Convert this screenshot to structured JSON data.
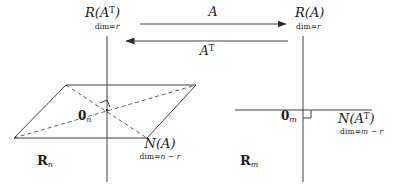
{
  "figure": {
    "stroke_color": "#2b2b2b",
    "background": "#ffffff"
  },
  "left_space": {
    "domain_label": "R",
    "domain_sub": "n",
    "origin_label": "0",
    "origin_sub": "n",
    "row_space": {
      "script": "R",
      "arg_open": "(",
      "arg": "A",
      "arg_sup": "T",
      "arg_close": ")",
      "dim_prefix": "dim",
      "dim_eq": "=",
      "dim_value": "r"
    },
    "null_space": {
      "script": "N",
      "arg_open": "(",
      "arg": "A",
      "arg_close": ")",
      "dim_prefix": "dim",
      "dim_eq": "=",
      "dim_value": "n − r"
    }
  },
  "right_space": {
    "domain_label": "R",
    "domain_sub": "m",
    "origin_label": "0",
    "origin_sub": "m",
    "column_space": {
      "script": "R",
      "arg_open": "(",
      "arg": "A",
      "arg_close": ")",
      "dim_prefix": "dim",
      "dim_eq": "=",
      "dim_value": "r"
    },
    "left_null_space": {
      "script": "N",
      "arg_open": "(",
      "arg": "A",
      "arg_sup": "T",
      "arg_close": ")",
      "dim_prefix": "dim",
      "dim_eq": "=",
      "dim_value": "m − r"
    }
  },
  "maps": {
    "forward": {
      "label": "A",
      "direction": "right"
    },
    "backward": {
      "label": "A",
      "sup": "T",
      "direction": "left"
    }
  }
}
